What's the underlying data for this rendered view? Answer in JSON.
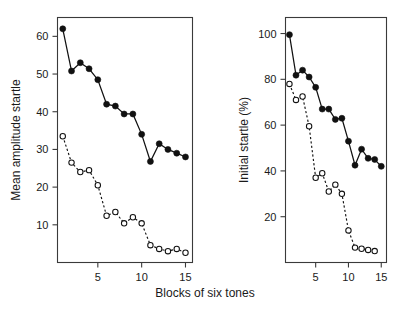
{
  "figure": {
    "xlabel": "Blocks of six tones",
    "panels": [
      {
        "id": "left",
        "ylabel": "Mean amplitude startle"
      },
      {
        "id": "right",
        "ylabel": "Initial startle (%)"
      }
    ]
  },
  "chart_data": [
    {
      "type": "line",
      "title": "",
      "xlabel": "Blocks of six tones",
      "ylabel": "Mean amplitude startle",
      "xlim": [
        0.4,
        15.8
      ],
      "ylim": [
        0,
        65
      ],
      "xticks": [
        5,
        10,
        15
      ],
      "yticks": [
        10,
        20,
        30,
        40,
        50,
        60
      ],
      "xticklabels": [
        "5",
        "10",
        "15"
      ],
      "yticklabels": [
        "10",
        "20",
        "30",
        "40",
        "50",
        "60"
      ],
      "grid": false,
      "legend": "none",
      "x": [
        1,
        2,
        3,
        4,
        5,
        6,
        7,
        8,
        9,
        10,
        11,
        12,
        13,
        14,
        15
      ],
      "series": [
        {
          "name": "filled-circles",
          "marker": "filled-circle",
          "linestyle": "solid",
          "values": [
            62.0,
            50.8,
            53.0,
            51.4,
            48.5,
            42.0,
            41.5,
            39.4,
            39.4,
            34.0,
            26.8,
            31.5,
            30.0,
            29.0,
            28.0
          ]
        },
        {
          "name": "open-circles",
          "marker": "open-circle",
          "linestyle": "dashed",
          "values": [
            33.5,
            26.5,
            24.0,
            24.5,
            20.5,
            12.4,
            13.4,
            10.4,
            12.0,
            10.4,
            4.6,
            3.6,
            3.0,
            3.6,
            2.6
          ]
        }
      ]
    },
    {
      "type": "line",
      "title": "",
      "xlabel": "Blocks of six tones",
      "ylabel": "Initial startle (%)",
      "xlim": [
        0.4,
        15.8
      ],
      "ylim": [
        0,
        107
      ],
      "xticks": [
        5,
        10,
        15
      ],
      "yticks": [
        20,
        40,
        60,
        80,
        100
      ],
      "xticklabels": [
        "5",
        "10",
        "15"
      ],
      "yticklabels": [
        "20",
        "40",
        "60",
        "80",
        "100"
      ],
      "grid": false,
      "legend": "none",
      "x": [
        1,
        2,
        3,
        4,
        5,
        6,
        7,
        8,
        9,
        10,
        11,
        12,
        13,
        14,
        15
      ],
      "series": [
        {
          "name": "filled-circles",
          "marker": "filled-circle",
          "linestyle": "solid",
          "values": [
            99.5,
            81.8,
            84.0,
            81.0,
            76.5,
            67.0,
            67.0,
            62.5,
            63.0,
            53.0,
            42.5,
            49.5,
            45.5,
            45.0,
            42.0
          ]
        },
        {
          "name": "open-circles",
          "marker": "open-circle",
          "linestyle": "dashed",
          "values": [
            78.0,
            71.0,
            72.5,
            59.5,
            37.0,
            39.0,
            31.0,
            34.0,
            30.0,
            14.0,
            6.5,
            6.0,
            5.5,
            5.0
          ]
        }
      ]
    }
  ],
  "colors": {
    "ink": "#111111",
    "axis": "#3a3a3a",
    "background": "#ffffff"
  }
}
